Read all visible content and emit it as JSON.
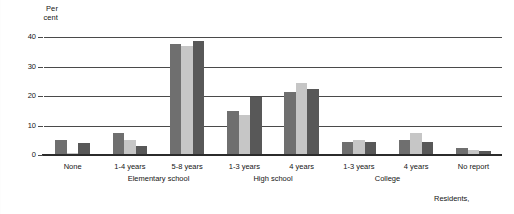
{
  "chart_data": {
    "type": "bar",
    "title": "",
    "subtitle": "",
    "xlabel": "",
    "ylabel": "Per cent",
    "ylabel_lines": [
      "Per",
      "cent"
    ],
    "ylim": [
      0,
      40
    ],
    "yticks": [
      0,
      10,
      20,
      30,
      40
    ],
    "ytick_labels": [
      "0",
      "10",
      "20",
      "30",
      "40"
    ],
    "grid": true,
    "grid_axis": "y",
    "legend": "none",
    "categories": [
      "None",
      "1-4 years",
      "5-8 years",
      "1-3 years",
      "4 years",
      "1-3 years",
      "4 years",
      "No report"
    ],
    "group_labels": [
      {
        "text": "Elementary school",
        "spans": [
          "1-4 years",
          "5-8 years"
        ]
      },
      {
        "text": "High school",
        "spans": [
          "1-3 years",
          "4 years"
        ]
      },
      {
        "text": "College",
        "spans": [
          "1-3 years",
          "4 years"
        ]
      }
    ],
    "series": [
      {
        "name": "series-1",
        "color": "#6f6f6f",
        "values": [
          5.0,
          7.5,
          37.5,
          15.0,
          21.5,
          4.5,
          5.0,
          2.5
        ]
      },
      {
        "name": "series-2",
        "color": "#c6c6c6",
        "values": [
          0.7,
          5.0,
          37.0,
          13.5,
          24.5,
          5.0,
          7.5,
          1.8
        ]
      },
      {
        "name": "series-3",
        "color": "#585858",
        "values": [
          4.0,
          3.0,
          38.5,
          19.5,
          22.5,
          4.5,
          4.5,
          1.5
        ]
      }
    ],
    "annotations": [
      {
        "text": "Residents,",
        "position": "bottom-right"
      }
    ]
  }
}
